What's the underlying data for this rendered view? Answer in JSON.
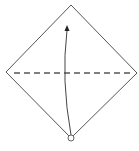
{
  "diagram": {
    "type": "origami-fold-step",
    "colors": {
      "outline": "#555555",
      "fold_line": "#555555",
      "arrow": "#444444",
      "background": "#ffffff"
    },
    "elements": [
      {
        "name": "paper-diamond",
        "shape": "diamond",
        "points": [
          [
            71,
            5
          ],
          [
            137,
            73
          ],
          [
            71,
            138
          ],
          [
            6,
            72
          ]
        ]
      },
      {
        "name": "valley-fold-line",
        "shape": "dashed-line",
        "from": [
          14,
          73
        ],
        "to": [
          134,
          73
        ]
      },
      {
        "name": "fold-arrow",
        "shape": "curved-arrow",
        "from": [
          71,
          136
        ],
        "to": [
          67,
          26
        ],
        "direction": "up"
      },
      {
        "name": "corner-marker",
        "shape": "circle",
        "center": [
          71,
          138
        ],
        "radius": 3
      }
    ]
  }
}
